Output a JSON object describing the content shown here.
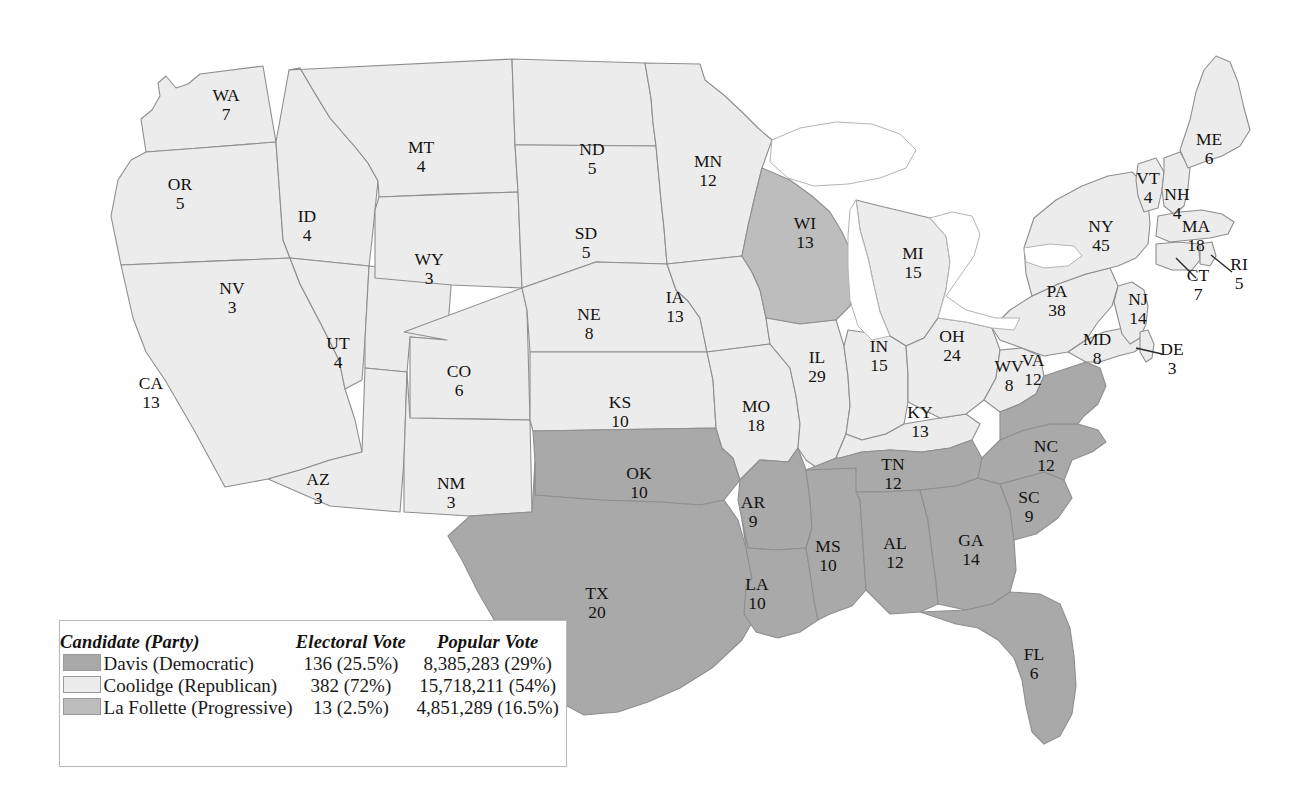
{
  "map": {
    "title": "1924 United States presidential election electoral map",
    "colors": {
      "democratic": "#a9a9a9",
      "republican": "#ececec",
      "progressive": "#bdbdbd",
      "border": "#8e8e8e",
      "text": "#14120f"
    },
    "states": [
      {
        "id": "WA",
        "abbr": "WA",
        "ev": "7",
        "party": "republican",
        "lx": 226,
        "ly": 101
      },
      {
        "id": "OR",
        "abbr": "OR",
        "ev": "5",
        "party": "republican",
        "lx": 180,
        "ly": 190
      },
      {
        "id": "CA",
        "abbr": "CA",
        "ev": "13",
        "party": "republican",
        "lx": 151,
        "ly": 389
      },
      {
        "id": "ID",
        "abbr": "ID",
        "ev": "4",
        "party": "republican",
        "lx": 307,
        "ly": 222
      },
      {
        "id": "NV",
        "abbr": "NV",
        "ev": "3",
        "party": "republican",
        "lx": 232,
        "ly": 294
      },
      {
        "id": "UT",
        "abbr": "UT",
        "ev": "4",
        "party": "republican",
        "lx": 338,
        "ly": 349
      },
      {
        "id": "AZ",
        "abbr": "AZ",
        "ev": "3",
        "party": "republican",
        "lx": 318,
        "ly": 485
      },
      {
        "id": "MT",
        "abbr": "MT",
        "ev": "4",
        "party": "republican",
        "lx": 421,
        "ly": 153
      },
      {
        "id": "WY",
        "abbr": "WY",
        "ev": "3",
        "party": "republican",
        "lx": 429,
        "ly": 265
      },
      {
        "id": "CO",
        "abbr": "CO",
        "ev": "6",
        "party": "republican",
        "lx": 459,
        "ly": 377
      },
      {
        "id": "NM",
        "abbr": "NM",
        "ev": "3",
        "party": "republican",
        "lx": 451,
        "ly": 489
      },
      {
        "id": "ND",
        "abbr": "ND",
        "ev": "5",
        "party": "republican",
        "lx": 592,
        "ly": 155
      },
      {
        "id": "SD",
        "abbr": "SD",
        "ev": "5",
        "party": "republican",
        "lx": 586,
        "ly": 239
      },
      {
        "id": "NE",
        "abbr": "NE",
        "ev": "8",
        "party": "republican",
        "lx": 589,
        "ly": 320
      },
      {
        "id": "KS",
        "abbr": "KS",
        "ev": "10",
        "party": "republican",
        "lx": 620,
        "ly": 408
      },
      {
        "id": "OK",
        "abbr": "OK",
        "ev": "10",
        "party": "democratic",
        "lx": 639,
        "ly": 479
      },
      {
        "id": "TX",
        "abbr": "TX",
        "ev": "20",
        "party": "democratic",
        "lx": 597,
        "ly": 599
      },
      {
        "id": "MN",
        "abbr": "MN",
        "ev": "12",
        "party": "republican",
        "lx": 708,
        "ly": 167
      },
      {
        "id": "IA",
        "abbr": "IA",
        "ev": "13",
        "party": "republican",
        "lx": 675,
        "ly": 303
      },
      {
        "id": "MO",
        "abbr": "MO",
        "ev": "18",
        "party": "republican",
        "lx": 756,
        "ly": 412
      },
      {
        "id": "AR",
        "abbr": "AR",
        "ev": "9",
        "party": "democratic",
        "lx": 753,
        "ly": 508
      },
      {
        "id": "LA",
        "abbr": "LA",
        "ev": "10",
        "party": "democratic",
        "lx": 757,
        "ly": 590
      },
      {
        "id": "WI",
        "abbr": "WI",
        "ev": "13",
        "party": "progressive",
        "lx": 805,
        "ly": 229
      },
      {
        "id": "IL",
        "abbr": "IL",
        "ev": "29",
        "party": "republican",
        "lx": 817,
        "ly": 363
      },
      {
        "id": "MS",
        "abbr": "MS",
        "ev": "10",
        "party": "democratic",
        "lx": 828,
        "ly": 552
      },
      {
        "id": "MI",
        "abbr": "MI",
        "ev": "15",
        "party": "republican",
        "lx": 913,
        "ly": 259
      },
      {
        "id": "IN",
        "abbr": "IN",
        "ev": "15",
        "party": "republican",
        "lx": 879,
        "ly": 352
      },
      {
        "id": "KY",
        "abbr": "KY",
        "ev": "13",
        "party": "republican",
        "lx": 920,
        "ly": 418
      },
      {
        "id": "TN",
        "abbr": "TN",
        "ev": "12",
        "party": "democratic",
        "lx": 893,
        "ly": 470
      },
      {
        "id": "AL",
        "abbr": "AL",
        "ev": "12",
        "party": "democratic",
        "lx": 895,
        "ly": 549
      },
      {
        "id": "OH",
        "abbr": "OH",
        "ev": "24",
        "party": "republican",
        "lx": 952,
        "ly": 342
      },
      {
        "id": "GA",
        "abbr": "GA",
        "ev": "14",
        "party": "democratic",
        "lx": 971,
        "ly": 546
      },
      {
        "id": "FL",
        "abbr": "FL",
        "ev": "6",
        "party": "democratic",
        "lx": 1034,
        "ly": 660
      },
      {
        "id": "WV",
        "abbr": "WV",
        "ev": "8",
        "party": "republican",
        "lx": 1009,
        "ly": 372
      },
      {
        "id": "SC",
        "abbr": "SC",
        "ev": "9",
        "party": "democratic",
        "lx": 1029,
        "ly": 503
      },
      {
        "id": "NC",
        "abbr": "NC",
        "ev": "12",
        "party": "democratic",
        "lx": 1046,
        "ly": 452
      },
      {
        "id": "VA",
        "abbr": "VA",
        "ev": "12",
        "party": "democratic",
        "lx": 1033,
        "ly": 366
      },
      {
        "id": "PA",
        "abbr": "PA",
        "ev": "38",
        "party": "republican",
        "lx": 1057,
        "ly": 297
      },
      {
        "id": "NY",
        "abbr": "NY",
        "ev": "45",
        "party": "republican",
        "lx": 1101,
        "ly": 232
      },
      {
        "id": "MD",
        "abbr": "MD",
        "ev": "8",
        "party": "republican",
        "lx": 1097,
        "ly": 345
      },
      {
        "id": "NJ",
        "abbr": "NJ",
        "ev": "14",
        "party": "republican",
        "lx": 1138,
        "ly": 305
      },
      {
        "id": "DE",
        "abbr": "DE",
        "ev": "3",
        "party": "republican",
        "lx": 1172,
        "ly": 355
      },
      {
        "id": "VT",
        "abbr": "VT",
        "ev": "4",
        "party": "republican",
        "lx": 1148,
        "ly": 184
      },
      {
        "id": "NH",
        "abbr": "NH",
        "ev": "4",
        "party": "republican",
        "lx": 1177,
        "ly": 200
      },
      {
        "id": "MA",
        "abbr": "MA",
        "ev": "18",
        "party": "republican",
        "lx": 1196,
        "ly": 232
      },
      {
        "id": "CT",
        "abbr": "CT",
        "ev": "7",
        "party": "republican",
        "lx": 1198,
        "ly": 281
      },
      {
        "id": "RI",
        "abbr": "RI",
        "ev": "5",
        "party": "republican",
        "lx": 1239,
        "ly": 270
      },
      {
        "id": "ME",
        "abbr": "ME",
        "ev": "6",
        "party": "republican",
        "lx": 1209,
        "ly": 145
      }
    ]
  },
  "legend": {
    "headers": {
      "candidate": "Candidate (Party)",
      "electoral": "Electoral Vote",
      "popular": "Popular Vote"
    },
    "rows": [
      {
        "party_key": "dem",
        "candidate": "Davis (Democratic)",
        "electoral": "136 (25.5%)",
        "popular": "8,385,283 (29%)",
        "swatch": "#a9a9a9"
      },
      {
        "party_key": "rep",
        "candidate": "Coolidge (Republican)",
        "electoral": "382 (72%)",
        "popular": "15,718,211 (54%)",
        "swatch": "#ececec"
      },
      {
        "party_key": "prog",
        "candidate": "La Follette (Progressive)",
        "electoral": "13 (2.5%)",
        "popular": "4,851,289 (16.5%)",
        "swatch": "#bdbdbd"
      }
    ]
  }
}
